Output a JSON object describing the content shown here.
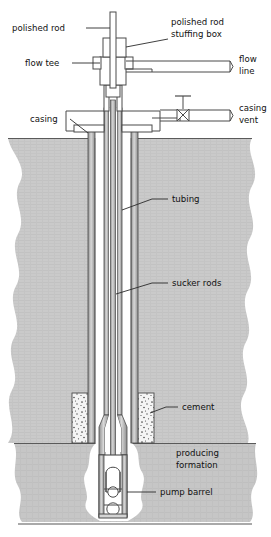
{
  "diagram": {
    "type": "cross-section",
    "canvas": {
      "width": 271,
      "height": 537
    },
    "colors": {
      "line": "#3a3a3a",
      "text": "#111111",
      "soil_fill": "#c9c9c9",
      "formation_fill": "#c4c4c4",
      "cement_fill": "#f2f2f2",
      "cement_speckle": "#555555",
      "pipe_fill": "#ffffff",
      "pipe_shade": "#9a9a9a",
      "wellbore_fill": "#ffffff",
      "background": "#ffffff"
    },
    "labels": [
      {
        "id": "polished-rod",
        "text": "polished rod",
        "lines": [
          "polished rod"
        ],
        "x": 12,
        "y": 31,
        "anchor": "start"
      },
      {
        "id": "polished-rod-stuffing-box",
        "text": "polished rod stuffing box",
        "lines": [
          "polished rod",
          "stuffing box"
        ],
        "x": 171,
        "y": 25,
        "anchor": "start"
      },
      {
        "id": "flow-tee",
        "text": "flow tee",
        "lines": [
          "flow tee"
        ],
        "x": 25,
        "y": 66,
        "anchor": "start"
      },
      {
        "id": "flow-line",
        "text": "flow line",
        "lines": [
          "flow",
          "line"
        ],
        "x": 239,
        "y": 62,
        "anchor": "start"
      },
      {
        "id": "casing-vent",
        "text": "casing vent",
        "lines": [
          "casing",
          "vent"
        ],
        "x": 239,
        "y": 110,
        "anchor": "start"
      },
      {
        "id": "casing",
        "text": "casing",
        "lines": [
          "casing"
        ],
        "x": 30,
        "y": 122,
        "anchor": "start"
      },
      {
        "id": "tubing",
        "text": "tubing",
        "lines": [
          "tubing"
        ],
        "x": 172,
        "y": 202,
        "anchor": "start"
      },
      {
        "id": "sucker-rods",
        "text": "sucker rods",
        "lines": [
          "sucker rods"
        ],
        "x": 172,
        "y": 286,
        "anchor": "start"
      },
      {
        "id": "cement",
        "text": "cement",
        "lines": [
          "cement"
        ],
        "x": 182,
        "y": 410,
        "anchor": "start"
      },
      {
        "id": "producing-formation",
        "text": "producing formation",
        "lines": [
          "producing",
          "formation"
        ],
        "x": 176,
        "y": 456,
        "anchor": "start"
      },
      {
        "id": "pump-barrel",
        "text": "pump barrel",
        "lines": [
          "pump barrel"
        ],
        "x": 160,
        "y": 495,
        "anchor": "start"
      }
    ],
    "components": [
      {
        "id": "polished-rod",
        "label": "polished rod",
        "note": "vertical rod at surface, top of rod string"
      },
      {
        "id": "polished-rod-stuffing-box",
        "label": "polished rod stuffing box",
        "note": "seal box above flow tee"
      },
      {
        "id": "flow-tee",
        "label": "flow tee",
        "note": "tee connecting tubing to flow line"
      },
      {
        "id": "flow-line",
        "label": "flow line",
        "note": "horizontal outlet line to right"
      },
      {
        "id": "casing-vent",
        "label": "casing vent",
        "note": "vented line with gate valve"
      },
      {
        "id": "casing",
        "label": "casing",
        "note": "outer steel pipe cemented in hole"
      },
      {
        "id": "tubing",
        "label": "tubing",
        "note": "inner production string"
      },
      {
        "id": "sucker-rods",
        "label": "sucker rods",
        "note": "rod string driving the downhole pump"
      },
      {
        "id": "cement",
        "label": "cement",
        "note": "cement sheath at casing shoe"
      },
      {
        "id": "producing-formation",
        "label": "producing formation",
        "note": "pay zone below cement"
      },
      {
        "id": "pump-barrel",
        "label": "pump barrel",
        "note": "downhole pump with traveling and standing valves"
      }
    ],
    "geometry": {
      "ground_level_y": 138,
      "formation_top_y": 443,
      "formation_bottom_y": 522,
      "casing_outer_left_x": 88,
      "casing_outer_right_x": 138,
      "tubing_left_x": 104,
      "tubing_right_x": 122,
      "rod_center_x": 113,
      "polished_rod_top_y": 12
    }
  }
}
